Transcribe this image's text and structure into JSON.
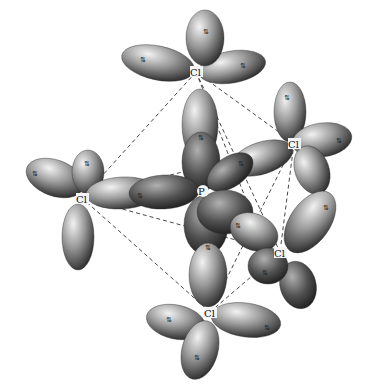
{
  "diagram": {
    "molecule": "PCl5",
    "geometry": "trigonal bipyramidal",
    "central_atom": {
      "label": "P",
      "x": 203,
      "y": 192
    },
    "atoms": [
      {
        "id": "cl-top",
        "label": "Cl",
        "x": 196,
        "y": 72
      },
      {
        "id": "cl-left",
        "label": "Cl",
        "x": 82,
        "y": 198
      },
      {
        "id": "cl-right-upper",
        "label": "Cl",
        "x": 294,
        "y": 143
      },
      {
        "id": "cl-right-lower",
        "label": "Cl",
        "x": 280,
        "y": 252
      },
      {
        "id": "cl-bottom",
        "label": "Cl",
        "x": 210,
        "y": 312
      }
    ],
    "electron_pair_symbol": "⇅",
    "colors": {
      "lobe_light": "#eeeeee",
      "lobe_mid": "#8a8a8a",
      "lobe_dark": "#1e1e1e",
      "bond_dash": "#333333",
      "background": "#ffffff"
    }
  }
}
